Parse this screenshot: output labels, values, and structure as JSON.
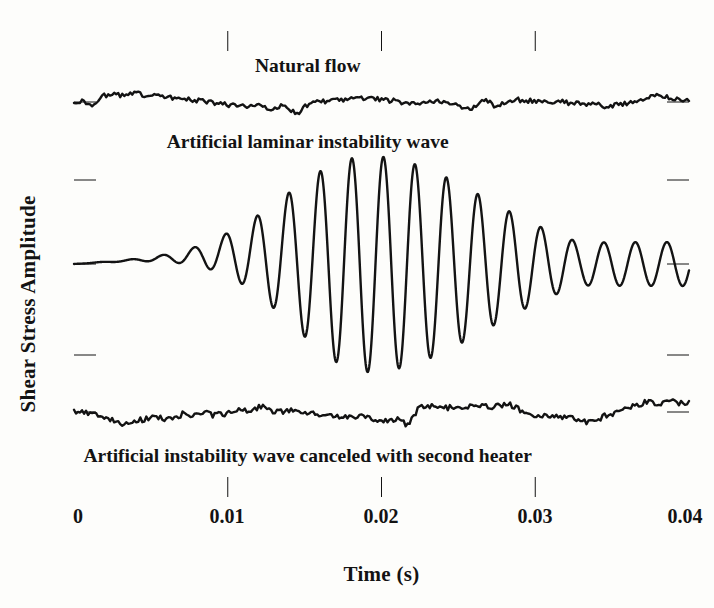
{
  "figure": {
    "background_color": "#fdfdfb",
    "ink_color": "#131313",
    "frame": {
      "left": 74,
      "top": 31,
      "right": 689,
      "bottom": 497,
      "line_width": 4
    }
  },
  "axes": {
    "y_title": "Shear Stress Amplitude",
    "x_title": "Time (s)",
    "y_ticks_count": 5,
    "y_tick_values": [
      0,
      1,
      2,
      3,
      4
    ],
    "y_tick_pixels": [
      102,
      180,
      264,
      355,
      412
    ],
    "x_tick_labels": [
      "0",
      "0.01",
      "0.02",
      "0.03",
      "0.04"
    ]
  },
  "chart_data": {
    "type": "line",
    "title": "",
    "xlabel": "Time (s)",
    "ylabel": "Shear Stress Amplitude",
    "xlim": [
      0,
      0.04
    ],
    "ylim": [
      0,
      1
    ],
    "grid": false,
    "legend": "inline-annotations",
    "x": [
      0,
      0.01,
      0.02,
      0.03,
      0.04
    ],
    "series": [
      {
        "name": "Natural flow",
        "annotation": "Natural flow",
        "annotation_x": 0.0152,
        "annotation_y_px": 72,
        "baseline_px": 102,
        "amplitude_px": 11,
        "description": "low-amplitude broadband turbulent noise about a flat baseline",
        "values_px": [
          102,
          101,
          103,
          106,
          100,
          96,
          95,
          95,
          95,
          94,
          94,
          94,
          95,
          95,
          95,
          96,
          97,
          98,
          99,
          99,
          100,
          101,
          102,
          103,
          104,
          104,
          105,
          106,
          106,
          107,
          106,
          105,
          108,
          111,
          107,
          104,
          110,
          115,
          108,
          104,
          103,
          102,
          101,
          100,
          100,
          99,
          99,
          98,
          98,
          99,
          99,
          100,
          100,
          101,
          102,
          103,
          104,
          105,
          104,
          103,
          102,
          102,
          103,
          104,
          106,
          108,
          110,
          105,
          99,
          103,
          108,
          104,
          101,
          100,
          100,
          101,
          101,
          102,
          101,
          101,
          102,
          102,
          103,
          103,
          104,
          104,
          105,
          105,
          106,
          106,
          105,
          104,
          103,
          101,
          99,
          97,
          96,
          96,
          97,
          98,
          99,
          100,
          101
        ]
      },
      {
        "name": "Artificial laminar instability wave",
        "annotation": "Artificial laminar instability wave",
        "annotation_x": 0.0152,
        "annotation_y_px": 148,
        "baseline_px": 264,
        "description": "growing then decaying Tollmien-Schlichting wave packet, ~14 cycles",
        "packet": {
          "period_px": 31.5,
          "phase_offset_px": 18,
          "peak_center_px": 368,
          "peak_amplitude_px": 108,
          "rise_width_px": 78,
          "fall_width_px": 118,
          "tail_amplitude_px": 22,
          "precursor_amplitude_px": 5
        }
      },
      {
        "name": "Artificial instability wave canceled with second heater",
        "annotation": "Artificial instability wave canceled with second heater",
        "annotation_x": 0.0152,
        "annotation_y_px": 462,
        "baseline_px": 412,
        "amplitude_px": 12,
        "description": "wave canceled; residual low-level noise comparable to natural flow",
        "values_px": [
          412,
          411,
          412,
          413,
          414,
          418,
          419,
          423,
          424,
          423,
          421,
          420,
          419,
          418,
          417,
          419,
          420,
          418,
          414,
          416,
          413,
          417,
          412,
          415,
          413,
          414,
          411,
          410,
          409,
          412,
          410,
          406,
          410,
          412,
          411,
          412,
          411,
          412,
          413,
          414,
          413,
          414,
          415,
          416,
          416,
          417,
          418,
          417,
          417,
          418,
          419,
          420,
          421,
          420,
          419,
          424,
          420,
          409,
          406,
          407,
          406,
          407,
          408,
          407,
          406,
          407,
          406,
          405,
          404,
          407,
          406,
          405,
          404,
          407,
          410,
          412,
          414,
          416,
          415,
          417,
          416,
          418,
          417,
          419,
          420,
          422,
          421,
          419,
          416,
          414,
          412,
          410,
          408,
          406,
          404,
          402,
          403,
          406,
          402,
          400,
          404,
          403,
          401
        ]
      }
    ]
  }
}
